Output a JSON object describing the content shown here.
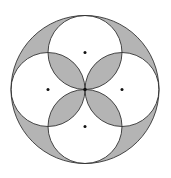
{
  "figure": {
    "colors": {
      "shade": "#b4b4b4",
      "stroke": "#333333",
      "background": "#ffffff",
      "dot": "#111111"
    },
    "big_circle": {
      "cx": 85,
      "cy": 89.5,
      "r": 74
    },
    "small_circles": [
      {
        "name": "top",
        "cx": 85,
        "cy": 52.5,
        "r": 37
      },
      {
        "name": "left",
        "cx": 48,
        "cy": 89.5,
        "r": 37
      },
      {
        "name": "right",
        "cx": 122,
        "cy": 89.5,
        "r": 37
      },
      {
        "name": "bottom",
        "cx": 85,
        "cy": 126.5,
        "r": 37
      }
    ],
    "center_dot": {
      "cx": 85,
      "cy": 89.5
    }
  }
}
